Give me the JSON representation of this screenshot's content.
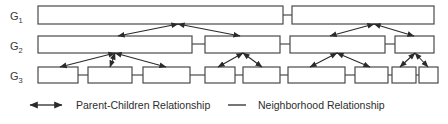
{
  "figure": {
    "background": "#ffffff",
    "box_stroke": "#4a4a4a",
    "box_fill": "#ffffff",
    "edge_color": "#2a2a2a",
    "text_color": "#2d2d2d",
    "width": 448,
    "height": 124
  },
  "levels": [
    {
      "id": "G1",
      "label": "G",
      "subscript": "1",
      "label_x": 10,
      "label_y": 20,
      "row_y": 6,
      "row_h": 18,
      "nodes": [
        {
          "name": "g1-n1",
          "x": 38,
          "y": 6,
          "w": 245,
          "h": 18
        },
        {
          "name": "g1-n2",
          "x": 292,
          "y": 6,
          "w": 142,
          "h": 18
        }
      ],
      "neighbor_links": [
        {
          "x1": 283,
          "x2": 292,
          "y": 15
        }
      ]
    },
    {
      "id": "G2",
      "label": "G",
      "subscript": "2",
      "label_x": 10,
      "label_y": 50,
      "row_y": 36,
      "row_h": 17,
      "nodes": [
        {
          "name": "g2-n1",
          "x": 38,
          "y": 36,
          "w": 154,
          "h": 17
        },
        {
          "name": "g2-n2",
          "x": 205,
          "y": 36,
          "w": 75,
          "h": 17
        },
        {
          "name": "g2-n3",
          "x": 290,
          "y": 36,
          "w": 95,
          "h": 17
        },
        {
          "name": "g2-n4",
          "x": 395,
          "y": 36,
          "w": 39,
          "h": 17
        }
      ],
      "neighbor_links": [
        {
          "x1": 192,
          "x2": 205,
          "y": 44
        },
        {
          "x1": 280,
          "x2": 290,
          "y": 44
        },
        {
          "x1": 385,
          "x2": 395,
          "y": 44
        }
      ]
    },
    {
      "id": "G3",
      "label": "G",
      "subscript": "3",
      "label_x": 10,
      "label_y": 80,
      "row_y": 67,
      "row_h": 16,
      "nodes": [
        {
          "name": "g3-n1",
          "x": 38,
          "y": 67,
          "w": 40,
          "h": 16
        },
        {
          "name": "g3-n2",
          "x": 88,
          "y": 67,
          "w": 44,
          "h": 16
        },
        {
          "name": "g3-n3",
          "x": 143,
          "y": 67,
          "w": 47,
          "h": 16
        },
        {
          "name": "g3-n4",
          "x": 205,
          "y": 67,
          "w": 30,
          "h": 16
        },
        {
          "name": "g3-n5",
          "x": 243,
          "y": 67,
          "w": 37,
          "h": 16
        },
        {
          "name": "g3-n6",
          "x": 288,
          "y": 67,
          "w": 57,
          "h": 16
        },
        {
          "name": "g3-n7",
          "x": 355,
          "y": 67,
          "w": 33,
          "h": 16
        },
        {
          "name": "g3-n8",
          "x": 392,
          "y": 67,
          "w": 24,
          "h": 16
        },
        {
          "name": "g3-n9",
          "x": 419,
          "y": 67,
          "w": 19,
          "h": 16
        }
      ],
      "neighbor_links": [
        {
          "x1": 78,
          "x2": 88,
          "y": 75
        },
        {
          "x1": 132,
          "x2": 143,
          "y": 75
        },
        {
          "x1": 190,
          "x2": 205,
          "y": 75
        },
        {
          "x1": 235,
          "x2": 243,
          "y": 75
        },
        {
          "x1": 280,
          "x2": 288,
          "y": 75
        },
        {
          "x1": 345,
          "x2": 355,
          "y": 75
        },
        {
          "x1": 388,
          "x2": 392,
          "y": 75
        },
        {
          "x1": 416,
          "x2": 419,
          "y": 75
        }
      ]
    }
  ],
  "parent_child_edges": [
    {
      "name": "pc-g1-to-g2-a",
      "hub_x": 178,
      "hub_y": 24,
      "targets": [
        [
          118,
          36
        ],
        [
          240,
          36
        ]
      ]
    },
    {
      "name": "pc-g1-to-g2-b",
      "hub_x": 374,
      "hub_y": 24,
      "targets": [
        [
          330,
          36
        ],
        [
          414,
          36
        ]
      ]
    },
    {
      "name": "pc-g2-to-g3-a",
      "hub_x": 115,
      "hub_y": 53,
      "targets": [
        [
          60,
          67
        ],
        [
          110,
          67
        ],
        [
          166,
          67
        ]
      ]
    },
    {
      "name": "pc-g2-to-g3-b",
      "hub_x": 243,
      "hub_y": 53,
      "targets": [
        [
          218,
          67
        ],
        [
          262,
          67
        ]
      ]
    },
    {
      "name": "pc-g2-to-g3-c",
      "hub_x": 337,
      "hub_y": 53,
      "targets": [
        [
          310,
          67
        ],
        [
          370,
          67
        ]
      ]
    },
    {
      "name": "pc-g2-to-g3-d",
      "hub_x": 415,
      "hub_y": 53,
      "targets": [
        [
          400,
          67
        ],
        [
          428,
          67
        ]
      ]
    }
  ],
  "legend": {
    "items": [
      {
        "id": "parent-children",
        "glyph": "double-arrow",
        "label": "Parent-Children Relationship",
        "glyph_x": 30,
        "glyph_y": 105,
        "glyph_w": 32,
        "label_x": 76,
        "label_y": 109
      },
      {
        "id": "neighborhood",
        "glyph": "plain-line",
        "label": "Neighborhood Relationship",
        "glyph_x": 228,
        "glyph_y": 105,
        "glyph_w": 18,
        "label_x": 258,
        "label_y": 109
      }
    ]
  }
}
